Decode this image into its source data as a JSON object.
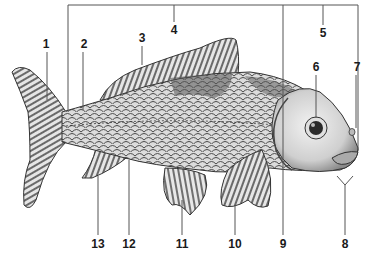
{
  "diagram": {
    "style": "grayscale line illustration with numbered callouts",
    "colors": {
      "background": "#ffffff",
      "ink": "#1a1a1a",
      "leader_line": "#555555",
      "body_light": "#d9d9d9",
      "body_dark": "#6e6e6e",
      "fin": "#a8a8a8"
    },
    "labels": [
      {
        "id": "1",
        "text": "1",
        "x": 46,
        "y": 44,
        "target": "caudal fin"
      },
      {
        "id": "2",
        "text": "2",
        "x": 84,
        "y": 44,
        "target": "caudal peduncle"
      },
      {
        "id": "3",
        "text": "3",
        "x": 142,
        "y": 38,
        "target": "dorsal fin"
      },
      {
        "id": "4",
        "text": "4",
        "x": 174,
        "y": 30,
        "target": "trunk (bracket)"
      },
      {
        "id": "5",
        "text": "5",
        "x": 323,
        "y": 33,
        "target": "head (bracket)"
      },
      {
        "id": "6",
        "text": "6",
        "x": 316,
        "y": 67,
        "target": "eye"
      },
      {
        "id": "7",
        "text": "7",
        "x": 357,
        "y": 67,
        "target": "nostril"
      },
      {
        "id": "8",
        "text": "8",
        "x": 345,
        "y": 244,
        "target": "barbels"
      },
      {
        "id": "9",
        "text": "9",
        "x": 283,
        "y": 244,
        "target": "operculum"
      },
      {
        "id": "10",
        "text": "10",
        "x": 235,
        "y": 244,
        "target": "pectoral fin"
      },
      {
        "id": "11",
        "text": "11",
        "x": 182,
        "y": 244,
        "target": "pelvic fin"
      },
      {
        "id": "12",
        "text": "12",
        "x": 129,
        "y": 244,
        "target": "lateral line"
      },
      {
        "id": "13",
        "text": "13",
        "x": 98,
        "y": 244,
        "target": "anal fin"
      }
    ]
  }
}
